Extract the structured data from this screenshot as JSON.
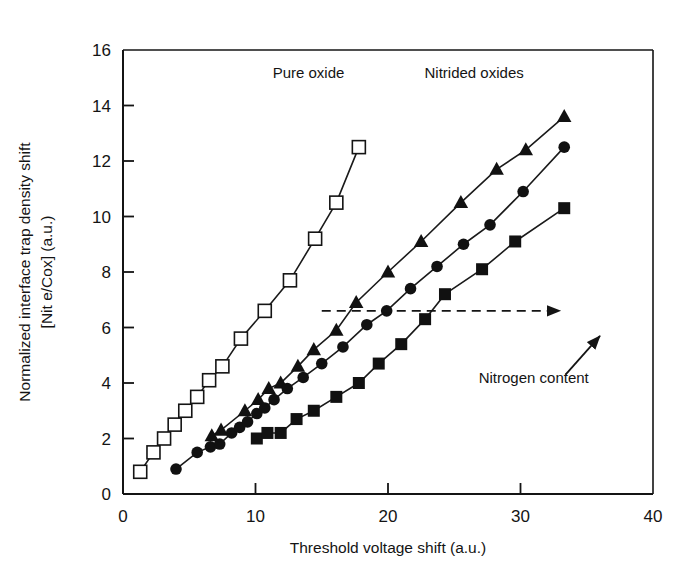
{
  "chart_data": {
    "type": "line",
    "title": "",
    "xlabel": "Threshold voltage shift (a.u.)",
    "ylabel_line1": "Normalized interface trap density shift",
    "ylabel_line2": "[Nit e/Cox] (a.u.)",
    "xlim": [
      0,
      40
    ],
    "ylim": [
      0,
      16
    ],
    "xticks": [
      0,
      10,
      20,
      30,
      40
    ],
    "yticks": [
      0,
      2,
      4,
      6,
      8,
      10,
      12,
      14,
      16
    ],
    "xtick_labels": [
      "0",
      "10",
      "20",
      "30",
      "40"
    ],
    "ytick_labels": [
      "0",
      "2",
      "4",
      "6",
      "8",
      "10",
      "12",
      "14",
      "16"
    ],
    "grid": false,
    "legend_position": "none",
    "series": [
      {
        "name": "Pure oxide",
        "marker": "open-square",
        "filled": false,
        "points": [
          [
            1.3,
            0.8
          ],
          [
            2.3,
            1.5
          ],
          [
            3.1,
            2.0
          ],
          [
            3.9,
            2.5
          ],
          [
            4.7,
            3.0
          ],
          [
            5.6,
            3.5
          ],
          [
            6.5,
            4.1
          ],
          [
            7.5,
            4.6
          ],
          [
            8.9,
            5.6
          ],
          [
            10.7,
            6.6
          ],
          [
            12.6,
            7.7
          ],
          [
            14.5,
            9.2
          ],
          [
            16.1,
            10.5
          ],
          [
            17.8,
            12.5
          ]
        ]
      },
      {
        "name": "Nitrided oxide - triangles",
        "marker": "filled-triangle",
        "filled": true,
        "points": [
          [
            6.7,
            2.1
          ],
          [
            7.4,
            2.3
          ],
          [
            9.2,
            3.0
          ],
          [
            10.2,
            3.4
          ],
          [
            11.0,
            3.8
          ],
          [
            11.9,
            4.0
          ],
          [
            13.2,
            4.6
          ],
          [
            14.4,
            5.2
          ],
          [
            16.1,
            5.9
          ],
          [
            17.6,
            6.9
          ],
          [
            20.0,
            8.0
          ],
          [
            22.5,
            9.1
          ],
          [
            25.5,
            10.5
          ],
          [
            28.2,
            11.7
          ],
          [
            30.4,
            12.4
          ],
          [
            33.3,
            13.6
          ]
        ]
      },
      {
        "name": "Nitrided oxide - circles",
        "marker": "filled-circle",
        "filled": true,
        "points": [
          [
            4.0,
            0.9
          ],
          [
            5.6,
            1.5
          ],
          [
            6.6,
            1.7
          ],
          [
            7.3,
            1.8
          ],
          [
            8.2,
            2.2
          ],
          [
            8.8,
            2.4
          ],
          [
            9.4,
            2.6
          ],
          [
            10.1,
            2.9
          ],
          [
            10.7,
            3.1
          ],
          [
            11.4,
            3.4
          ],
          [
            12.4,
            3.8
          ],
          [
            13.6,
            4.2
          ],
          [
            15.0,
            4.7
          ],
          [
            16.6,
            5.3
          ],
          [
            18.4,
            6.1
          ],
          [
            19.9,
            6.6
          ],
          [
            21.7,
            7.4
          ],
          [
            23.7,
            8.2
          ],
          [
            25.7,
            9.0
          ],
          [
            27.7,
            9.7
          ],
          [
            30.2,
            10.9
          ],
          [
            33.3,
            12.5
          ]
        ]
      },
      {
        "name": "Nitrided oxide - squares",
        "marker": "filled-square",
        "filled": true,
        "points": [
          [
            10.1,
            2.0
          ],
          [
            10.9,
            2.2
          ],
          [
            11.9,
            2.2
          ],
          [
            13.1,
            2.7
          ],
          [
            14.4,
            3.0
          ],
          [
            16.1,
            3.5
          ],
          [
            17.8,
            4.0
          ],
          [
            19.3,
            4.7
          ],
          [
            21.0,
            5.4
          ],
          [
            22.8,
            6.3
          ],
          [
            24.3,
            7.2
          ],
          [
            27.1,
            8.1
          ],
          [
            29.6,
            9.1
          ],
          [
            33.3,
            10.3
          ]
        ]
      }
    ],
    "annotations": [
      {
        "name": "pure-oxide-label",
        "text": "Pure oxide",
        "x": 14.0,
        "y": 15.0
      },
      {
        "name": "nitrided-oxides-label",
        "text": "Nitrided oxides",
        "x": 26.5,
        "y": 15.0
      },
      {
        "name": "nitrogen-content-label",
        "text": "Nitrogen content",
        "x": 31.0,
        "y": 4.0
      }
    ],
    "arrows": [
      {
        "name": "dashed-trend-arrow",
        "style": "dashed",
        "x_start": 15.0,
        "y_start": 6.6,
        "x_end": 33.0,
        "y_end": 6.6
      },
      {
        "name": "nitrogen-content-arrow",
        "style": "solid",
        "x_start": 33.4,
        "y_start": 4.3,
        "x_end": 36.0,
        "y_end": 5.7
      }
    ]
  },
  "colors": {
    "axis": "#141414",
    "marker_fill": "#111111",
    "marker_open_fill": "#ffffff",
    "line": "#1a1a1a",
    "background": "#ffffff"
  }
}
